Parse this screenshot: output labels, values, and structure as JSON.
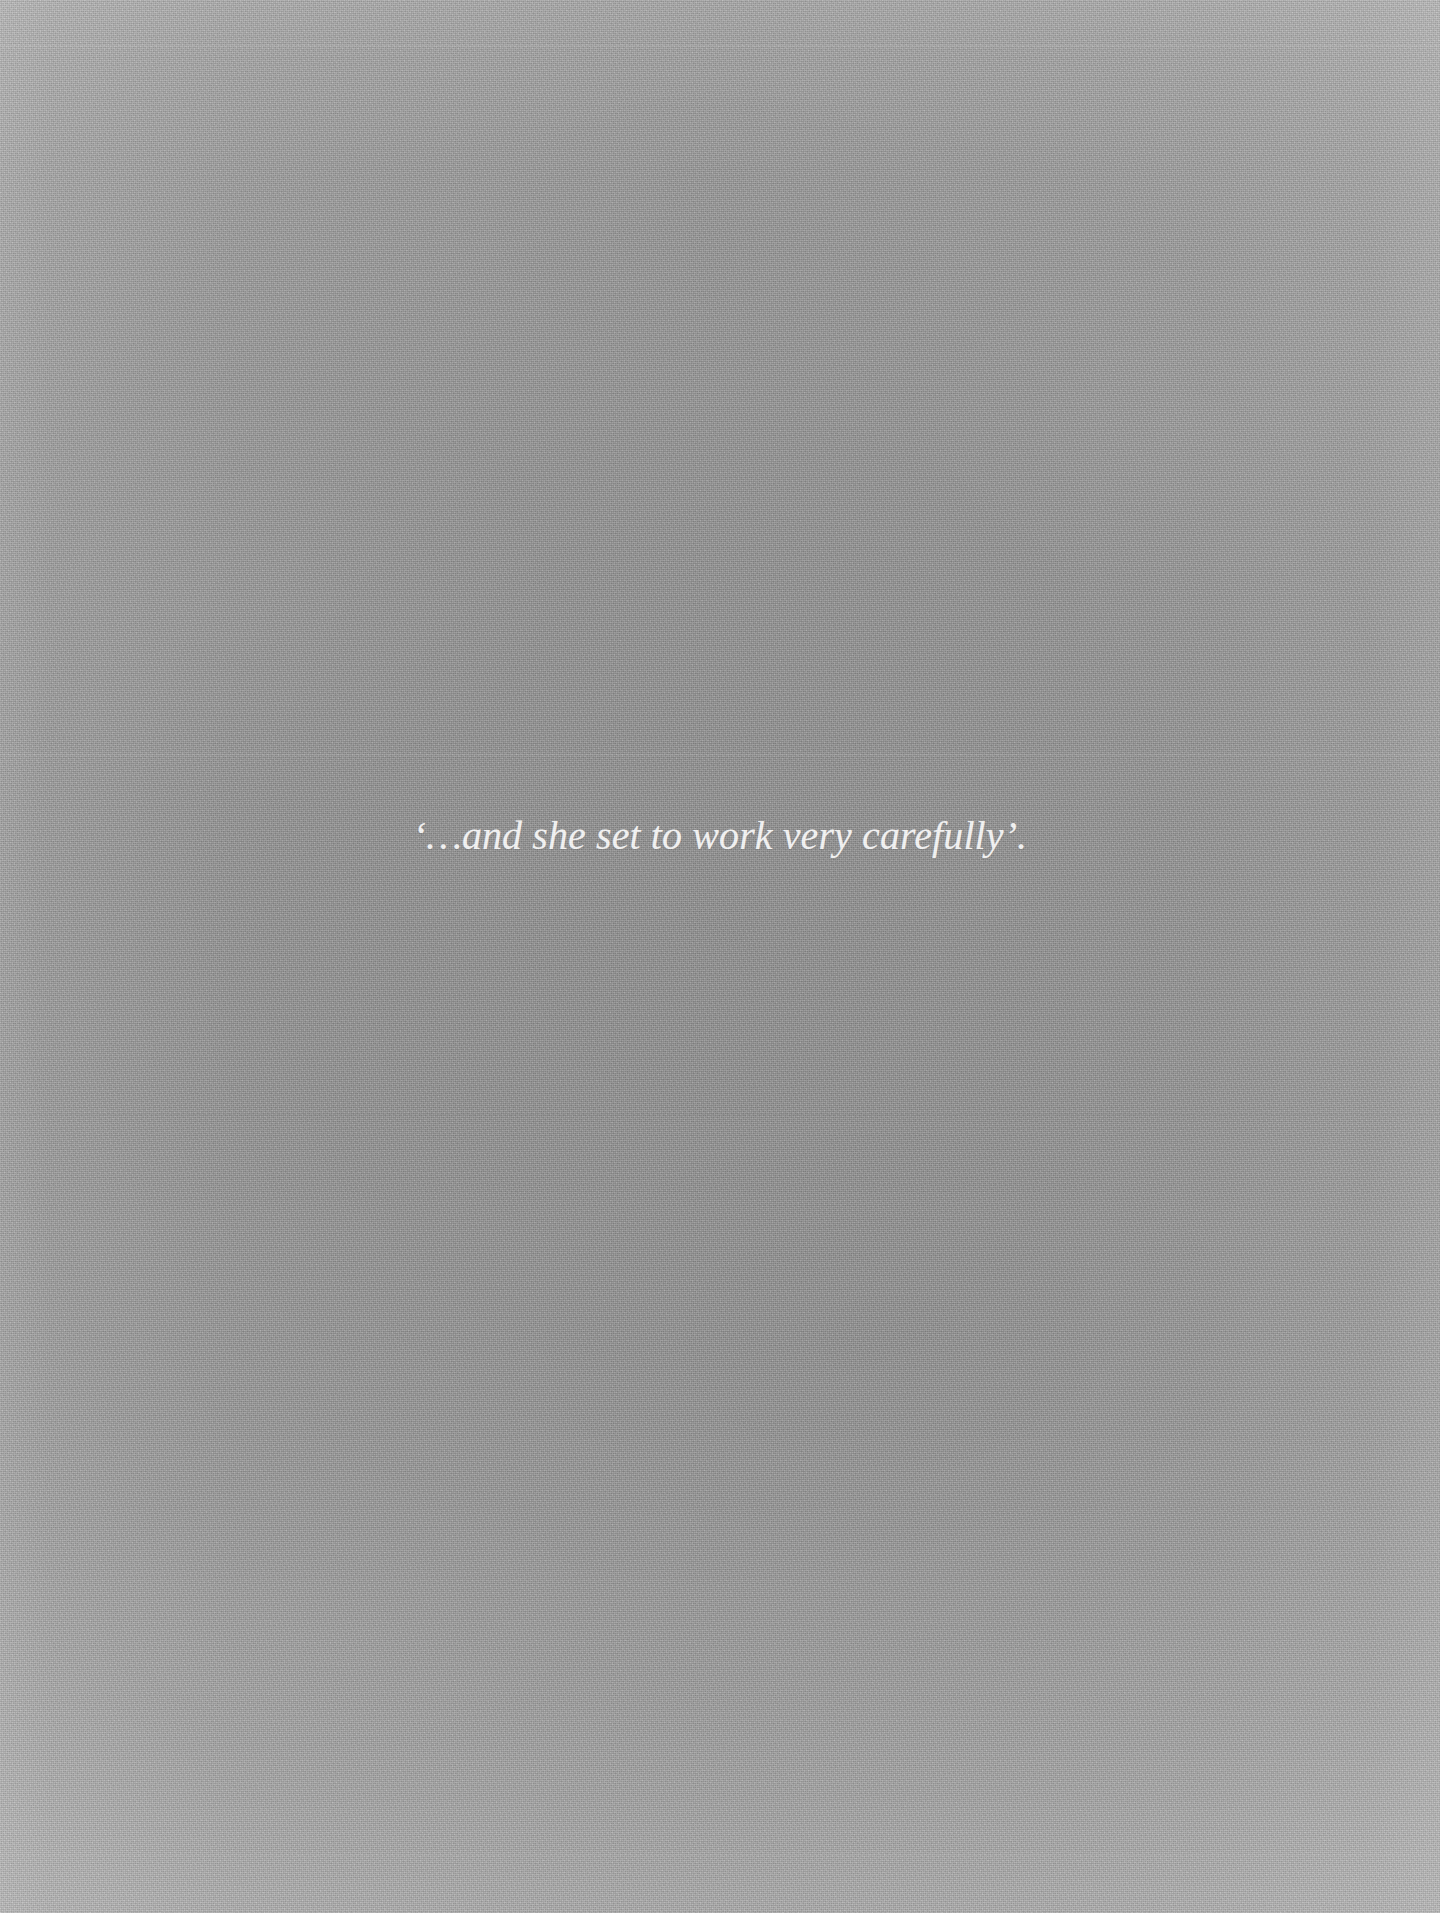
{
  "page": {
    "width": 1440,
    "height": 1913,
    "background_color": "#a6a6a6",
    "edge_tint_color": "#c4c4c4",
    "center_tint_color": "#a3a3a3"
  },
  "caption": {
    "text": "‘…and she set to work very carefully’.",
    "color": "#f4f4f4",
    "style": "italic-serif",
    "alignment": "center"
  }
}
